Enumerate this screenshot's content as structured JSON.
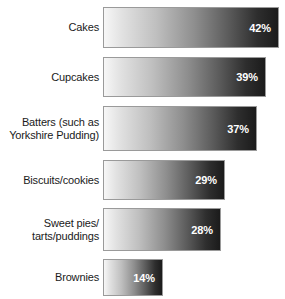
{
  "chart_data": {
    "type": "bar",
    "orientation": "horizontal",
    "title": "",
    "xlabel": "",
    "ylabel": "",
    "grid": false,
    "legend": null,
    "value_suffix": "%",
    "xlim": [
      0,
      42
    ],
    "categories": [
      "Cakes",
      "Cupcakes",
      "Batters (such as\nYorkshire Pudding)",
      "Biscuits/cookies",
      "Sweet pies/\ntarts/puddings",
      "Brownies"
    ],
    "values": [
      42,
      39,
      37,
      29,
      28,
      14
    ],
    "value_labels": [
      "42%",
      "39%",
      "37%",
      "29%",
      "28%",
      "14%"
    ],
    "bar_style": {
      "fill": "linear-gradient-grayscale-light-to-dark",
      "border_color": "#9a9a9a",
      "label_color": "#ffffff"
    }
  },
  "rows": [
    {
      "label": "Cakes",
      "value_label": "42%",
      "top": 7,
      "height": 41,
      "bar_width": 176
    },
    {
      "label": "Cupcakes",
      "value_label": "39%",
      "top": 57,
      "height": 40,
      "bar_width": 163
    },
    {
      "label": "Batters (such as\nYorkshire Pudding)",
      "value_label": "37%",
      "top": 106,
      "height": 45,
      "bar_width": 154
    },
    {
      "label": "Biscuits/cookies",
      "value_label": "29%",
      "top": 160,
      "height": 40,
      "bar_width": 122
    },
    {
      "label": "Sweet pies/\ntarts/puddings",
      "value_label": "28%",
      "top": 208,
      "height": 43,
      "bar_width": 118
    },
    {
      "label": "Brownies",
      "value_label": "14%",
      "top": 259,
      "height": 37,
      "bar_width": 60
    }
  ]
}
